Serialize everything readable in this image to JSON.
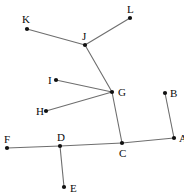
{
  "figure": {
    "canvas": {
      "width": 184,
      "height": 195,
      "background": "#ffffff"
    },
    "style": {
      "line_color": "#6e6e6e",
      "point_color": "#111111",
      "label_color": "#0b0b0b",
      "line_width": 1.1,
      "point_radius": 2.1,
      "label_font_size": 11
    },
    "points": [
      {
        "id": "A",
        "label": "A",
        "x": 174,
        "y": 138,
        "label_x": 179,
        "label_y": 133
      },
      {
        "id": "B",
        "label": "B",
        "x": 165,
        "y": 93,
        "label_x": 170,
        "label_y": 88
      },
      {
        "id": "C",
        "label": "C",
        "x": 122,
        "y": 143,
        "label_x": 119,
        "label_y": 148
      },
      {
        "id": "D",
        "label": "D",
        "x": 60,
        "y": 146,
        "label_x": 57,
        "label_y": 132
      },
      {
        "id": "E",
        "label": "E",
        "x": 64,
        "y": 187,
        "label_x": 70,
        "label_y": 183
      },
      {
        "id": "F",
        "label": "F",
        "x": 7,
        "y": 148,
        "label_x": 4,
        "label_y": 134
      },
      {
        "id": "G",
        "label": "G",
        "x": 112,
        "y": 92,
        "label_x": 118,
        "label_y": 87
      },
      {
        "id": "H",
        "label": "H",
        "x": 46,
        "y": 111,
        "label_x": 36,
        "label_y": 106
      },
      {
        "id": "I",
        "label": "I",
        "x": 56,
        "y": 80,
        "label_x": 48,
        "label_y": 75
      },
      {
        "id": "J",
        "label": "J",
        "x": 85,
        "y": 45,
        "label_x": 82,
        "label_y": 31
      },
      {
        "id": "K",
        "label": "K",
        "x": 27,
        "y": 29,
        "label_x": 22,
        "label_y": 14
      },
      {
        "id": "L",
        "label": "L",
        "x": 130,
        "y": 18,
        "label_x": 127,
        "label_y": 4
      }
    ],
    "segments": [
      {
        "id": "K-J",
        "from": "K",
        "to": "J"
      },
      {
        "id": "J-L",
        "from": "J",
        "to": "L"
      },
      {
        "id": "J-G",
        "from": "J",
        "to": "G"
      },
      {
        "id": "I-G",
        "from": "I",
        "to": "G"
      },
      {
        "id": "H-G",
        "from": "H",
        "to": "G"
      },
      {
        "id": "G-C",
        "from": "G",
        "to": "C"
      },
      {
        "id": "F-D",
        "from": "F",
        "to": "D"
      },
      {
        "id": "D-C",
        "from": "D",
        "to": "C"
      },
      {
        "id": "C-A",
        "from": "C",
        "to": "A"
      },
      {
        "id": "D-E",
        "from": "D",
        "to": "E"
      },
      {
        "id": "B-A",
        "from": "B",
        "to": "A"
      }
    ]
  }
}
